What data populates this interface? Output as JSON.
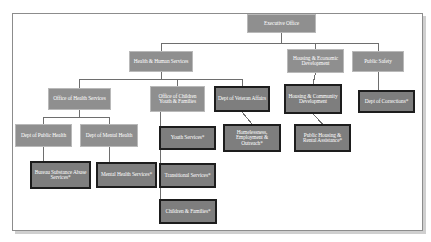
{
  "chart_data": {
    "type": "diagram",
    "nodes": [
      {
        "id": "executive-office",
        "label": "Executive Office",
        "style": "light",
        "level": 0,
        "x": 247,
        "y": 14,
        "w": 69,
        "h": 19,
        "font": 5.4
      },
      {
        "id": "health-human-services",
        "label": "Health & Human Services",
        "style": "light",
        "level": 1,
        "x": 129,
        "y": 51,
        "w": 64,
        "h": 21,
        "font": 5.4
      },
      {
        "id": "housing-economic-development",
        "label": "Housing & Economic Development",
        "style": "light",
        "level": 1,
        "x": 287,
        "y": 49,
        "w": 57,
        "h": 24,
        "font": 5.4
      },
      {
        "id": "public-safety",
        "label": "Public Safety",
        "style": "light",
        "level": 1,
        "x": 352,
        "y": 51,
        "w": 52,
        "h": 21,
        "font": 5.4
      },
      {
        "id": "office-of-health-services",
        "label": "Office of Health Services",
        "style": "light",
        "level": 2,
        "x": 48,
        "y": 88,
        "w": 63,
        "h": 22,
        "font": 5.4
      },
      {
        "id": "office-of-children-youth-families",
        "label": "Office of Children Youth & Families",
        "style": "light",
        "level": 2,
        "x": 150,
        "y": 86,
        "w": 55,
        "h": 26,
        "font": 5.4
      },
      {
        "id": "dept-of-veteran-affairs",
        "label": "Dept of Veteran Affairs",
        "style": "dark",
        "level": 2,
        "x": 214,
        "y": 86,
        "w": 56,
        "h": 26,
        "font": 5.4
      },
      {
        "id": "housing-community-development",
        "label": "Housing & Community Development",
        "style": "dark",
        "level": 2,
        "x": 284,
        "y": 84,
        "w": 58,
        "h": 30,
        "font": 5.4
      },
      {
        "id": "dept-of-corrections",
        "label": "Dept of Corrections*",
        "style": "dark",
        "level": 3,
        "x": 358,
        "y": 90,
        "w": 57,
        "h": 23,
        "font": 5.4
      },
      {
        "id": "dept-of-public-health",
        "label": "Dept of Public Health",
        "style": "light",
        "level": 3,
        "x": 15,
        "y": 124,
        "w": 57,
        "h": 23,
        "font": 5.4
      },
      {
        "id": "dept-of-mental-health",
        "label": "Dept of Mental Health",
        "style": "light",
        "level": 3,
        "x": 80,
        "y": 124,
        "w": 58,
        "h": 23,
        "font": 5.4
      },
      {
        "id": "youth-services",
        "label": "Youth Services*",
        "style": "dark",
        "level": 3,
        "x": 159,
        "y": 126,
        "w": 57,
        "h": 24,
        "font": 5.4
      },
      {
        "id": "homelessness-employment-outreach",
        "label": "Homelessness, Employment & Outreach*",
        "style": "dark",
        "level": 3,
        "x": 223,
        "y": 124,
        "w": 58,
        "h": 28,
        "font": 5.4
      },
      {
        "id": "public-housing-rental-assistance",
        "label": "Public Housing & Rental Assistance*",
        "style": "dark",
        "level": 3,
        "x": 294,
        "y": 124,
        "w": 57,
        "h": 28,
        "font": 5.4
      },
      {
        "id": "bureau-substance-abuse-services",
        "label": "Bureau Substance Abuse Services*",
        "style": "dark",
        "level": 4,
        "x": 30,
        "y": 161,
        "w": 61,
        "h": 28,
        "font": 5.4
      },
      {
        "id": "mental-health-services",
        "label": "Mental Health Services*",
        "style": "dark",
        "level": 4,
        "x": 96,
        "y": 162,
        "w": 61,
        "h": 26,
        "font": 5.4
      },
      {
        "id": "transitional-services",
        "label": "Transitional Services*",
        "style": "dark",
        "level": 4,
        "x": 159,
        "y": 163,
        "w": 57,
        "h": 25,
        "font": 5.4
      },
      {
        "id": "children-families",
        "label": "Children & Families*",
        "style": "dark",
        "level": 5,
        "x": 159,
        "y": 199,
        "w": 58,
        "h": 25,
        "font": 5.4
      }
    ],
    "edges": [
      {
        "from": "executive-office",
        "to": "health-human-services"
      },
      {
        "from": "executive-office",
        "to": "housing-economic-development"
      },
      {
        "from": "executive-office",
        "to": "public-safety"
      },
      {
        "from": "health-human-services",
        "to": "office-of-health-services"
      },
      {
        "from": "health-human-services",
        "to": "office-of-children-youth-families"
      },
      {
        "from": "health-human-services",
        "to": "dept-of-veteran-affairs"
      },
      {
        "from": "housing-economic-development",
        "to": "housing-community-development"
      },
      {
        "from": "public-safety",
        "to": "dept-of-corrections"
      },
      {
        "from": "office-of-health-services",
        "to": "dept-of-public-health"
      },
      {
        "from": "office-of-health-services",
        "to": "dept-of-mental-health"
      },
      {
        "from": "office-of-children-youth-families",
        "to": "youth-services"
      },
      {
        "from": "office-of-children-youth-families",
        "to": "transitional-services"
      },
      {
        "from": "office-of-children-youth-families",
        "to": "children-families"
      },
      {
        "from": "dept-of-veteran-affairs",
        "to": "homelessness-employment-outreach"
      },
      {
        "from": "housing-community-development",
        "to": "public-housing-rental-assistance"
      },
      {
        "from": "dept-of-public-health",
        "to": "bureau-substance-abuse-services"
      },
      {
        "from": "dept-of-mental-health",
        "to": "mental-health-services"
      }
    ],
    "colors": {
      "node_fill_light": "#8f8f8f",
      "node_fill_dark": "#7e7e7e",
      "node_border_light": "#b9b9b9",
      "node_border_dark": "#1d1d1d",
      "node_text": "#ffffff",
      "connector": "#6e6e6e",
      "frame_border": "#8c8c8c",
      "background": "#ffffff"
    }
  }
}
